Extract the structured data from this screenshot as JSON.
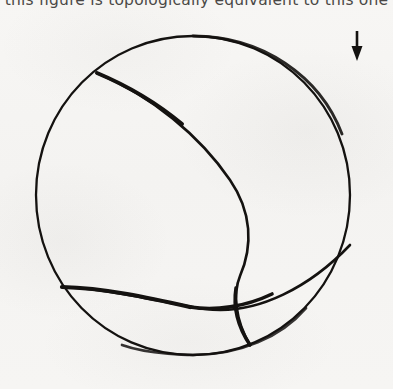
{
  "page": {
    "width": 393,
    "height": 389,
    "background_color": "#f6f5f3",
    "ink_color": "#141210"
  },
  "caption": {
    "text": "this figure is topologically equivalent to this one",
    "clipped_at_top": true
  },
  "figure": {
    "name": "sphere-with-three-curves",
    "circle": {
      "center_x": 193,
      "center_y": 195,
      "radius": 157,
      "stroke_width": 2.4
    },
    "curves": [
      {
        "name": "main-meridian-curve",
        "start": [
          97,
          73
        ],
        "end": [
          250,
          345
        ],
        "bulge_max_x": 250,
        "bulge_at_y": 195
      },
      {
        "name": "lower-horizontal-curve",
        "start": [
          62,
          287
        ],
        "end": [
          350,
          245
        ],
        "dip_y": 309,
        "dip_at_x": 205
      },
      {
        "name": "crossing-point",
        "at": [
          233,
          307
        ]
      }
    ]
  },
  "arrow": {
    "name": "down-arrow",
    "direction": "down",
    "x": 357,
    "top_y": 31,
    "bottom_y": 61,
    "shaft_width": 2.4,
    "head_width": 11,
    "head_height": 13
  }
}
